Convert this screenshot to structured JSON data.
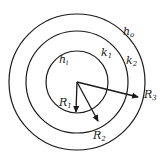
{
  "diagram": {
    "type": "concentric-circles",
    "center": {
      "x": 77,
      "y": 82
    },
    "colors": {
      "stroke": "#1a1a1a",
      "background": "#ffffff"
    },
    "circles": [
      {
        "id": "inner",
        "r": 31
      },
      {
        "id": "middle",
        "r": 51
      },
      {
        "id": "outer",
        "r": 68
      }
    ],
    "labels": {
      "h_i": {
        "base": "h",
        "sub": "i"
      },
      "k_1": {
        "base": "k",
        "sub": "1"
      },
      "k_2": {
        "base": "k",
        "sub": "2"
      },
      "h_o": {
        "base": "h",
        "sub": "o"
      },
      "R_1": {
        "base": "R",
        "sub": "1"
      },
      "R_2": {
        "base": "R",
        "sub": "2"
      },
      "R_3": {
        "base": "R",
        "sub": "3"
      }
    },
    "arrows": [
      {
        "id": "R1",
        "to": {
          "x": 76,
          "y": 114
        }
      },
      {
        "id": "R2",
        "to": {
          "x": 99,
          "y": 123
        }
      },
      {
        "id": "R3",
        "to": {
          "x": 140,
          "y": 98
        }
      }
    ]
  }
}
